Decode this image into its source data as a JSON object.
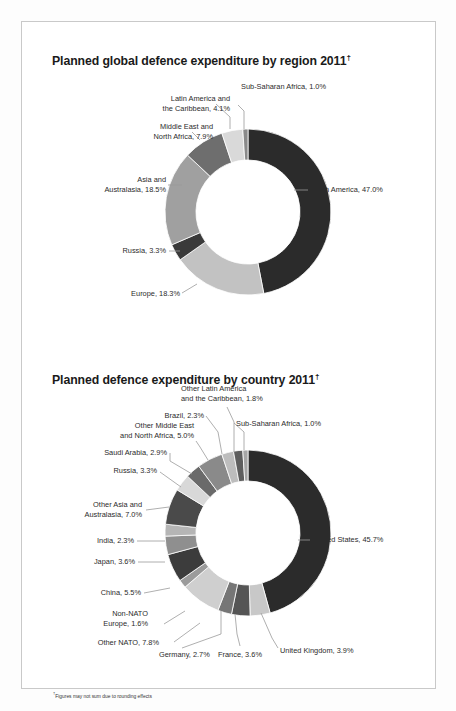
{
  "page": {
    "background": "#fdfdfd",
    "panel_border_color": "#c9c9c9"
  },
  "charts": [
    {
      "title": "Planned global defence expenditure by region 2011",
      "title_marker": "†"
    },
    {
      "title": "Planned defence expenditure by country 2011",
      "title_marker": "†"
    }
  ],
  "footnote": {
    "marker": "†",
    "text": "Figures may not sum due to rounding effects"
  },
  "labels": {
    "c1": {
      "latin_america": "Latin America and",
      "latin_america2": "the Caribbean, 4.1%",
      "subsaharan": "Sub-Saharan Africa, 1.0%",
      "mena": "Middle East and",
      "mena2": "North Africa, 7.9%",
      "asia": "Asia and",
      "asia2": "Australasia, 18.5%",
      "russia": "Russia, 3.3%",
      "europe": "Europe, 18.3%",
      "northamerica": "North America, 47.0%"
    },
    "c2": {
      "other_latin": "Other Latin America",
      "other_latin2": "and the Caribbean, 1.8%",
      "brazil": "Brazil, 2.3%",
      "subsaharan": "Sub-Saharan Africa, 1.0%",
      "other_mena": "Other Middle East",
      "other_mena2": "and North Africa, 5.0%",
      "saudi": "Saudi Arabia, 2.9%",
      "russia": "Russia, 3.3%",
      "other_asia": "Other Asia and",
      "other_asia2": "Australasia, 7.0%",
      "india": "India, 2.3%",
      "japan": "Japan, 3.6%",
      "china": "China, 5.5%",
      "nonnato": "Non-NATO",
      "nonnato2": "Europe, 1.6%",
      "othernato": "Other NATO, 7.8%",
      "germany": "Germany, 2.7%",
      "france": "France, 3.6%",
      "uk": "United Kingdom, 3.9%",
      "us": "United States, 45.7%"
    }
  },
  "chart_data": [
    {
      "type": "pie",
      "variant": "donut",
      "title": "Planned global defence expenditure by region 2011",
      "note": "Figures may not sum due to rounding effects",
      "unit": "percent",
      "start_angle_deg": 0,
      "direction": "clockwise",
      "categories": [
        "North America",
        "Europe",
        "Russia",
        "Asia and Australasia",
        "Middle East and North Africa",
        "Latin America and the Caribbean",
        "Sub-Saharan Africa"
      ],
      "values": [
        47.0,
        18.3,
        3.3,
        18.5,
        7.9,
        4.1,
        1.0
      ],
      "colors": [
        "#2b2b2b",
        "#c2c2c2",
        "#3a3a3a",
        "#a0a0a0",
        "#6e6e6e",
        "#d9d9d9",
        "#8a8a8a"
      ],
      "legend": "labels-outside"
    },
    {
      "type": "pie",
      "variant": "donut",
      "title": "Planned defence expenditure by country 2011",
      "note": "Figures may not sum due to rounding effects",
      "unit": "percent",
      "start_angle_deg": 0,
      "direction": "clockwise",
      "categories": [
        "United States",
        "United Kingdom",
        "France",
        "Germany",
        "Other NATO",
        "Non-NATO Europe",
        "China",
        "Japan",
        "India",
        "Other Asia and Australasia",
        "Russia",
        "Saudi Arabia",
        "Other Middle East and North Africa",
        "Brazil",
        "Other Latin America and the Caribbean",
        "Sub-Saharan Africa"
      ],
      "values": [
        45.7,
        3.9,
        3.6,
        2.7,
        7.8,
        1.6,
        5.5,
        3.6,
        2.3,
        7.0,
        3.3,
        2.9,
        5.0,
        2.3,
        1.8,
        1.0
      ],
      "colors": [
        "#2b2b2b",
        "#c8c8c8",
        "#555555",
        "#767676",
        "#cfcfcf",
        "#9b9b9b",
        "#3c3c3c",
        "#8f8f8f",
        "#b5b5b5",
        "#4a4a4a",
        "#d8d8d8",
        "#6a6a6a",
        "#8a8a8a",
        "#bdbdbd",
        "#5e5e5e",
        "#a6a6a6"
      ],
      "legend": "labels-outside"
    }
  ]
}
